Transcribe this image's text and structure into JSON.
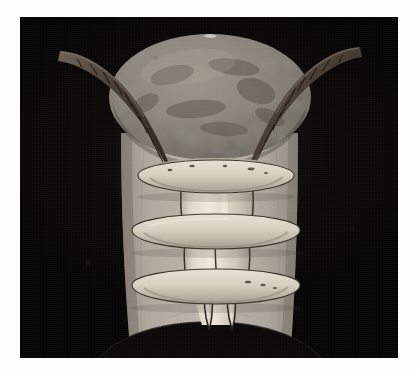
{
  "image": {
    "domain": "Natural-Image",
    "subject": "mounted animal hide panel with horns, bone rings and tusks",
    "orientation": "portrait",
    "width_px": 417,
    "height_px": 374,
    "caption": ""
  },
  "frame": {
    "mount_color": "#fdfdfd",
    "photo_left": 20,
    "photo_top": 17,
    "photo_width": 378,
    "photo_height": 341
  },
  "background": {
    "name": "black studio backdrop",
    "color": "#0b0908",
    "highlight_color": "#15120f",
    "vignette": "true"
  },
  "objects": {
    "hide_panel": {
      "name": "hide panel",
      "description": "trapezoidal pale grey-tan hide, widest at top, with a large arc notch cut from the bottom edge",
      "color_light": "#b9b3a8",
      "color_mid": "#a8a196",
      "color_dark": "#8d8780",
      "top_y": 120,
      "bottom_y": 330,
      "left_top_x": 100,
      "right_top_x": 278,
      "left_bottom_x": 110,
      "right_bottom_x": 270
    },
    "dome": {
      "name": "oval dome cap",
      "description": "large mottled grey-brown oval shell or skull cap spanning the upper half",
      "color_light": "#9a938a",
      "color_mid": "#837c73",
      "color_dark": "#5e5851",
      "center_x": 190,
      "center_y": 78,
      "radius_x": 100,
      "radius_y": 62,
      "top_notch": "small pale nick at top centre"
    },
    "horns": [
      {
        "name": "left horn",
        "side": "left",
        "description": "dark ridged horn sweeping up and out to the upper left, segmented with transverse ribs",
        "color_dark": "#3a3029",
        "color_light": "#6f6258",
        "tip_x": 62,
        "tip_y": 52,
        "base_x": 160,
        "base_y": 155,
        "segments": 11
      },
      {
        "name": "right horn",
        "side": "right",
        "description": "dark ridged horn sweeping up and out to the upper right, mirror of the left",
        "color_dark": "#3a3029",
        "color_light": "#6f6258",
        "tip_x": 330,
        "tip_y": 48,
        "base_x": 228,
        "base_y": 155,
        "segments": 11
      }
    ],
    "center_bone": {
      "name": "central bone column",
      "description": "pale cream vertical bone / palate running down the centre of the hide",
      "color_light": "#e6e0d4",
      "color_mid": "#d2ccbe",
      "color_shadow": "#b4ad9f",
      "top_y": 150,
      "bottom_y": 300,
      "left_x": 162,
      "right_x": 232
    },
    "rings": [
      {
        "name": "upper bone ring",
        "index": 1,
        "center_x": 196,
        "center_y": 158,
        "radius_x": 78,
        "radius_y": 15,
        "color_light": "#ded7c8",
        "color_dark": "#a69e90",
        "speckles": "true"
      },
      {
        "name": "middle bone ring",
        "index": 2,
        "center_x": 196,
        "center_y": 213,
        "radius_x": 84,
        "radius_y": 16,
        "color_light": "#ded7c8",
        "color_dark": "#a69e90",
        "speckles": "false"
      },
      {
        "name": "lower bone ring",
        "index": 3,
        "center_x": 196,
        "center_y": 268,
        "radius_x": 84,
        "radius_y": 16,
        "color_light": "#ded7c8",
        "color_dark": "#a69e90",
        "speckles": "true"
      }
    ],
    "tusks": [
      {
        "name": "left tusk",
        "side": "left",
        "tip_x": 190,
        "tip_y": 312,
        "top_x": 188,
        "top_y": 268,
        "color": "#ded8cb"
      },
      {
        "name": "right tusk",
        "side": "right",
        "tip_x": 213,
        "tip_y": 312,
        "top_x": 212,
        "top_y": 268,
        "color": "#ded8cb"
      }
    ],
    "bottom_notch": {
      "name": "bottom arc notch",
      "description": "wide dark arc removed from the lower edge of the hide panel",
      "center_x": 190,
      "top_y": 305,
      "radius_x": 118,
      "radius_y": 52
    }
  }
}
